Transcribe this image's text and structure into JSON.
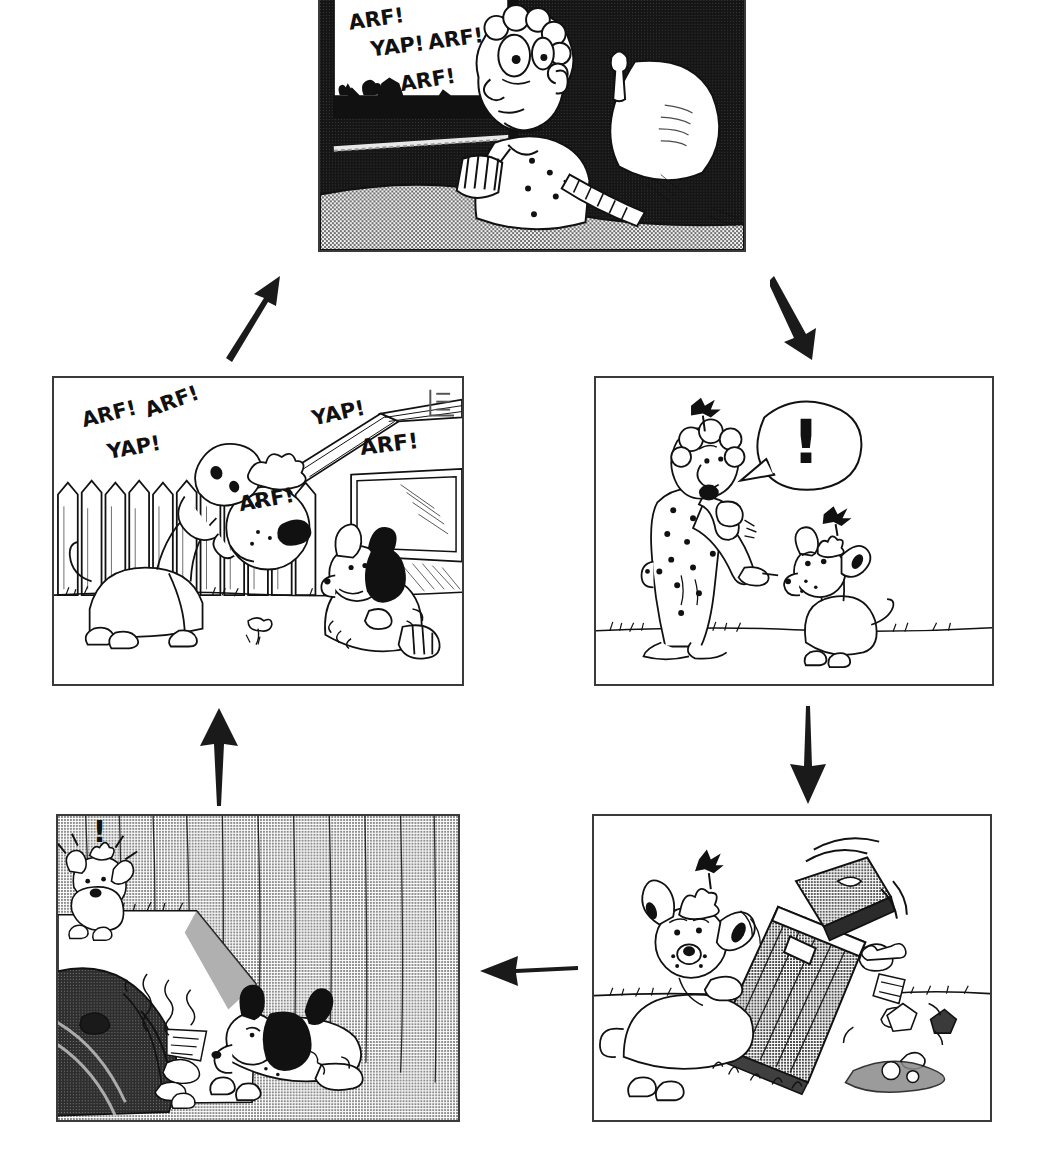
{
  "document": {
    "kind": "comic-strip-cycle-diagram",
    "title": "Barking Dog Cycle",
    "background_color": "#ffffff",
    "ink_color": "#111111",
    "panel_border_color": "#3a3a3a"
  },
  "panels": [
    {
      "id": "panel-top",
      "name": "man-awake-in-bed",
      "position": "top-center",
      "caption": "Man lying awake in bed at night, window showing dark yard",
      "scene": "night-bedroom",
      "sfx": [
        "ARF!",
        "YAP! ARF!",
        "ARF!"
      ],
      "sfx_lines": [
        {
          "text": "ARF!",
          "x": 30,
          "y": 30,
          "rotate": -8,
          "size": 21
        },
        {
          "text": "YAP!",
          "x": 52,
          "y": 57,
          "rotate": -7,
          "size": 21
        },
        {
          "text": "ARF!",
          "x": 110,
          "y": 50,
          "rotate": -8,
          "size": 21
        },
        {
          "text": "ARF!",
          "x": 82,
          "y": 92,
          "rotate": -9,
          "size": 21
        }
      ],
      "rect": {
        "x": 318,
        "y": 0,
        "w": 428,
        "h": 252
      }
    },
    {
      "id": "panel-mid-left",
      "name": "two-dogs-barking-in-yard",
      "position": "middle-left",
      "caption": "Big spotted dog and shaggy dog barking at each other across the yard by the fence",
      "scene": "daytime-backyard-fence",
      "sfx": [
        "ARF!",
        "ARF!",
        "YAP!",
        "ARF!",
        "YAP!",
        "ARF!"
      ],
      "sfx_lines": [
        {
          "text": "ARF!",
          "x": 30,
          "y": 50,
          "rotate": -14,
          "size": 21
        },
        {
          "text": "ARF!",
          "x": 95,
          "y": 40,
          "rotate": -20,
          "size": 21
        },
        {
          "text": "YAP!",
          "x": 55,
          "y": 82,
          "rotate": -10,
          "size": 21
        },
        {
          "text": "ARF!",
          "x": 188,
          "y": 135,
          "rotate": -10,
          "size": 21
        },
        {
          "text": "YAP!",
          "x": 262,
          "y": 48,
          "rotate": -12,
          "size": 21
        },
        {
          "text": "ARF!",
          "x": 310,
          "y": 78,
          "rotate": -7,
          "size": 22
        }
      ],
      "signature": "artist-monogram",
      "rect": {
        "x": 52,
        "y": 376,
        "w": 412,
        "h": 310
      }
    },
    {
      "id": "panel-mid-right",
      "name": "man-scolding-dog",
      "position": "middle-right",
      "caption": "Man in polka-dot pajamas pointing and scolding the dog outdoors",
      "scene": "daytime-yard",
      "speech_bubble": "!",
      "rect": {
        "x": 594,
        "y": 376,
        "w": 400,
        "h": 310
      }
    },
    {
      "id": "panel-bottom-right",
      "name": "dog-tipping-trash-can",
      "position": "bottom-right",
      "caption": "Dog knocking over a metal trash can, lid flying and garbage spilling out",
      "scene": "daytime-yard",
      "rect": {
        "x": 592,
        "y": 814,
        "w": 400,
        "h": 308
      }
    },
    {
      "id": "panel-bottom-left",
      "name": "shaggy-dog-eating-garbage",
      "position": "bottom-left",
      "caption": "Night scene: small dog shocked at left while the shaggy dog eats spilled garbage by the fence",
      "scene": "night-yard-fence",
      "exclamation": "!",
      "rect": {
        "x": 56,
        "y": 814,
        "w": 404,
        "h": 308
      }
    }
  ],
  "arrows": [
    {
      "id": "arrow-bl-to-ml",
      "name": "arrow-up-left-column",
      "direction": "up",
      "from": "panel-bottom-left",
      "to": "panel-mid-left",
      "rect": {
        "x": 198,
        "y": 706,
        "w": 42,
        "h": 100
      }
    },
    {
      "id": "arrow-ml-to-top",
      "name": "arrow-up-right-diagonal",
      "direction": "up-right",
      "from": "panel-mid-left",
      "to": "panel-top",
      "rect": {
        "x": 218,
        "y": 272,
        "w": 72,
        "h": 90
      }
    },
    {
      "id": "arrow-top-to-mr",
      "name": "arrow-down-right-diagonal",
      "direction": "down-right",
      "from": "panel-top",
      "to": "panel-mid-right",
      "rect": {
        "x": 770,
        "y": 272,
        "w": 60,
        "h": 90
      }
    },
    {
      "id": "arrow-mr-to-br",
      "name": "arrow-down-right-column",
      "direction": "down",
      "from": "panel-mid-right",
      "to": "panel-bottom-right",
      "rect": {
        "x": 788,
        "y": 706,
        "w": 40,
        "h": 100
      }
    },
    {
      "id": "arrow-br-to-bl",
      "name": "arrow-left-bottom-row",
      "direction": "left",
      "from": "panel-bottom-right",
      "to": "panel-bottom-left",
      "rect": {
        "x": 478,
        "y": 948,
        "w": 100,
        "h": 44
      }
    }
  ],
  "cycle_order": [
    "panel-top",
    "panel-mid-right",
    "panel-bottom-right",
    "panel-bottom-left",
    "panel-mid-left",
    "panel-top"
  ]
}
